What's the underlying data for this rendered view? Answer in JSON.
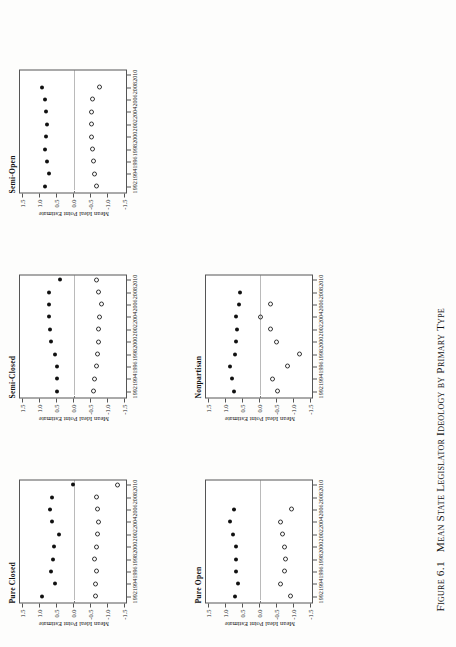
{
  "figure": {
    "number_label": "Figure 6.1",
    "caption": "Mean State Legislator Ideology by Primary Type"
  },
  "axes": {
    "y_title": "Mean Ideal Point Estimate",
    "y_ticks": [
      "1.5",
      "1.0",
      "0.5",
      "0.0",
      "-0.5",
      "-1.0",
      "-1.5"
    ],
    "y_values": [
      1.5,
      1.0,
      0.5,
      0.0,
      -0.5,
      -1.0,
      -1.5
    ],
    "y_lim": [
      -1.6,
      1.6
    ],
    "x_ticks": [
      "1992",
      "1994",
      "1996",
      "1998",
      "2000",
      "2002",
      "2004",
      "2006",
      "2008",
      "2010"
    ],
    "x_values": [
      1992,
      1994,
      1996,
      1998,
      2000,
      2002,
      2004,
      2006,
      2008,
      2010
    ],
    "x_lim": [
      1991,
      2011
    ],
    "zero_reference_line": "0.0"
  },
  "chart_data": {
    "type": "scatter",
    "title": "Mean State Legislator Ideology by Primary Type",
    "xlabel": "",
    "ylabel": "Mean Ideal Point Estimate",
    "xlim": [
      1991,
      2011
    ],
    "ylim": [
      -1.6,
      1.6
    ],
    "grid": false,
    "legend": "none",
    "series_styles": {
      "republican": "filled-circle",
      "democrat": "open-circle"
    },
    "panels": [
      {
        "title": "Pure Closed",
        "x": [
          1992,
          1994,
          1996,
          1998,
          2000,
          2002,
          2004,
          2006,
          2008,
          2010
        ],
        "series": [
          {
            "name": "Republican",
            "marker": "filled",
            "values": [
              0.95,
              0.55,
              0.68,
              0.63,
              0.6,
              0.45,
              0.65,
              0.7,
              0.64,
              0.03
            ]
          },
          {
            "name": "Democrat",
            "marker": "open",
            "values": [
              -0.63,
              -0.64,
              -0.66,
              -0.62,
              -0.66,
              -0.7,
              -0.72,
              -0.7,
              -0.68,
              -1.3
            ]
          }
        ]
      },
      {
        "title": "Semi-Closed",
        "x": [
          1992,
          1994,
          1996,
          1998,
          2000,
          2002,
          2004,
          2006,
          2008,
          2010
        ],
        "series": [
          {
            "name": "Republican",
            "marker": "filled",
            "values": [
              0.5,
              0.5,
              0.5,
              0.56,
              0.68,
              0.7,
              0.73,
              0.74,
              0.74,
              0.42
            ]
          },
          {
            "name": "Democrat",
            "marker": "open",
            "values": [
              -0.58,
              -0.62,
              -0.66,
              -0.7,
              -0.72,
              -0.74,
              -0.76,
              -0.8,
              -0.72,
              -0.66
            ]
          }
        ]
      },
      {
        "title": "Semi-Open",
        "x": [
          1992,
          1994,
          1996,
          1998,
          2000,
          2002,
          2004,
          2006,
          2008,
          2010
        ],
        "series": [
          {
            "name": "Republican",
            "marker": "filled",
            "values": [
              0.86,
              0.74,
              0.81,
              0.85,
              0.83,
              0.79,
              0.84,
              0.86,
              0.95,
              null
            ]
          },
          {
            "name": "Democrat",
            "marker": "open",
            "values": [
              -0.66,
              -0.6,
              -0.57,
              -0.55,
              -0.53,
              -0.52,
              -0.53,
              -0.56,
              -0.75,
              null
            ]
          }
        ]
      },
      {
        "title": "Nonpartisan",
        "x": [
          1992,
          1994,
          1996,
          1998,
          2000,
          2002,
          2004,
          2006,
          2008,
          2010
        ],
        "series": [
          {
            "name": "Republican",
            "marker": "filled",
            "values": [
              0.78,
              0.82,
              0.88,
              0.73,
              0.72,
              0.68,
              0.7,
              0.62,
              0.6,
              null
            ]
          },
          {
            "name": "Democrat",
            "marker": "open",
            "values": [
              -0.52,
              -0.37,
              -0.8,
              -1.18,
              -0.5,
              -0.3,
              -0.02,
              -0.32,
              null,
              null
            ]
          }
        ]
      },
      {
        "title": "Pure Open",
        "x": [
          1992,
          1994,
          1996,
          1998,
          2000,
          2002,
          2004,
          2006,
          2008,
          2010
        ],
        "series": [
          {
            "name": "Republican",
            "marker": "filled",
            "values": [
              0.73,
              0.64,
              0.72,
              0.71,
              0.7,
              0.8,
              0.9,
              0.76,
              null,
              null
            ]
          },
          {
            "name": "Democrat",
            "marker": "open",
            "values": [
              -0.9,
              -0.6,
              -0.72,
              -0.76,
              -0.72,
              -0.68,
              -0.6,
              -0.92,
              null,
              null
            ]
          }
        ]
      }
    ]
  }
}
